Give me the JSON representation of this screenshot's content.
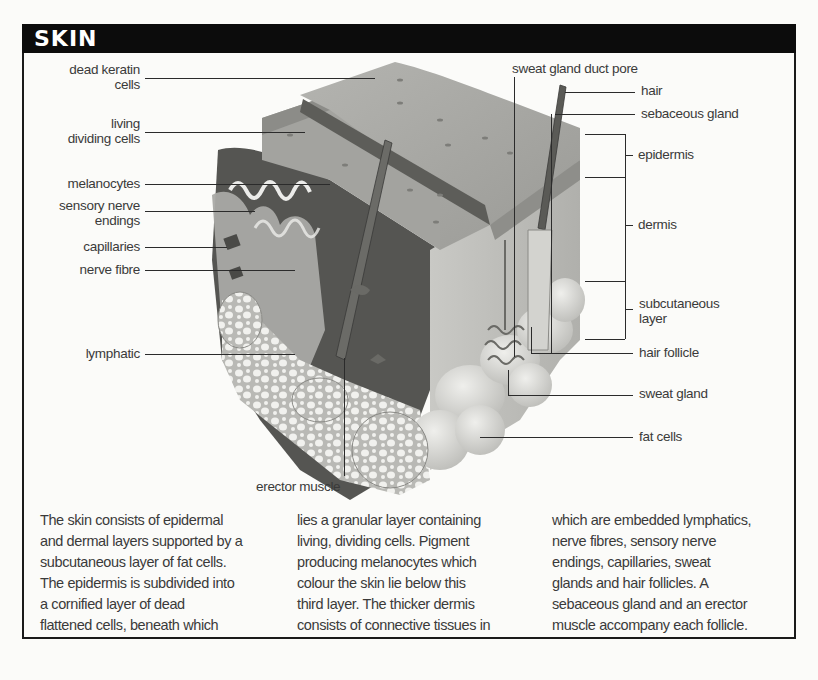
{
  "header": {
    "title": "SKIN"
  },
  "diagram": {
    "left_labels": [
      {
        "id": "dead-keratin-cells",
        "text_line1": "dead keratin",
        "text_line2": "cells"
      },
      {
        "id": "living-dividing-cells",
        "text_line1": "living",
        "text_line2": "dividing cells"
      },
      {
        "id": "melanocytes",
        "text_line1": "melanocytes",
        "text_line2": ""
      },
      {
        "id": "sensory-nerve-endings",
        "text_line1": "sensory nerve",
        "text_line2": "endings"
      },
      {
        "id": "capillaries",
        "text_line1": "capillaries",
        "text_line2": ""
      },
      {
        "id": "nerve-fibre",
        "text_line1": "nerve fibre",
        "text_line2": ""
      },
      {
        "id": "lymphatic",
        "text_line1": "lymphatic",
        "text_line2": ""
      }
    ],
    "top_label": {
      "id": "sweat-gland-duct-pore",
      "text": "sweat gland duct pore"
    },
    "right_labels": [
      {
        "id": "hair",
        "text_line1": "hair",
        "text_line2": ""
      },
      {
        "id": "sebaceous-gland",
        "text_line1": "sebaceous gland",
        "text_line2": ""
      },
      {
        "id": "epidermis",
        "text_line1": "epidermis",
        "text_line2": ""
      },
      {
        "id": "dermis",
        "text_line1": "dermis",
        "text_line2": ""
      },
      {
        "id": "subcutaneous-layer",
        "text_line1": "subcutaneous",
        "text_line2": "layer"
      },
      {
        "id": "hair-follicle",
        "text_line1": "hair follicle",
        "text_line2": ""
      },
      {
        "id": "sweat-gland",
        "text_line1": "sweat gland",
        "text_line2": ""
      },
      {
        "id": "fat-cells",
        "text_line1": "fat cells",
        "text_line2": ""
      }
    ],
    "bottom_label": {
      "id": "erector-muscle",
      "text": "erector muscle"
    }
  },
  "body_text": {
    "columns": [
      [
        "The skin consists of epidermal",
        "and dermal layers supported by a",
        "subcutaneous layer of fat cells.",
        "The epidermis is subdivided into",
        "a cornified layer of dead",
        "flattened cells, beneath which"
      ],
      [
        "lies a granular layer containing",
        "living, dividing cells. Pigment",
        "producing melanocytes which",
        "colour the skin lie below this",
        "third layer. The thicker dermis",
        "consists of connective tissues in"
      ],
      [
        "which are embedded lymphatics,",
        "nerve fibres, sensory nerve",
        "endings, capillaries, sweat",
        "glands and hair follicles. A",
        "sebaceous gland and an erector",
        "muscle accompany each follicle."
      ]
    ]
  },
  "colors": {
    "header_bg": "#0c0c0c",
    "header_text": "#ffffff",
    "page_bg": "#fbfbf9",
    "text": "#3a3a3a",
    "skin_surface": "#a7a7a3",
    "skin_dark": "#4a4a4a",
    "fat": "#d8d8d4"
  }
}
